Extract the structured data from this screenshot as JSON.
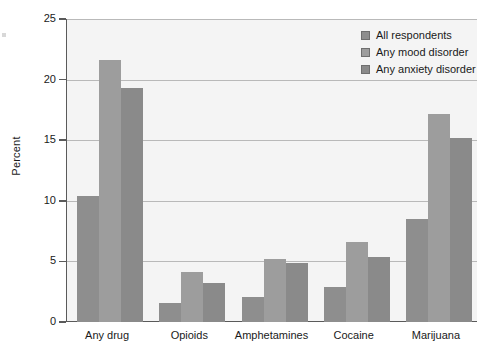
{
  "chart_data": {
    "type": "bar",
    "title": "",
    "xlabel": "",
    "ylabel": "Percent",
    "ylim": [
      0,
      25
    ],
    "yticks": [
      0,
      5,
      10,
      15,
      20,
      25
    ],
    "ytick_labels": [
      "0",
      "5",
      "10",
      "15",
      "20",
      "25"
    ],
    "grid": true,
    "legend_position": "top-right",
    "categories": [
      "Any drug",
      "Opioids",
      "Amphetamines",
      "Cocaine",
      "Marijuana"
    ],
    "series": [
      {
        "name": "All respondents",
        "color": "#8e8e8e",
        "values": [
          10.4,
          1.6,
          2.1,
          2.9,
          8.5
        ]
      },
      {
        "name": "Any mood disorder",
        "color": "#9d9d9d",
        "values": [
          21.6,
          4.1,
          5.2,
          6.6,
          17.2
        ]
      },
      {
        "name": "Any anxiety disorder",
        "color": "#8a8a8a",
        "values": [
          19.3,
          3.2,
          4.85,
          5.4,
          15.2
        ]
      }
    ]
  },
  "legend": {
    "items": [
      {
        "label": "All respondents"
      },
      {
        "label": "Any mood disorder"
      },
      {
        "label": "Any anxiety disorder"
      }
    ]
  },
  "colors": {
    "series_1": "#8e8e8e",
    "series_2": "#9d9d9d",
    "series_3": "#8a8a8a",
    "plot_background": "#f4f4f4",
    "axis": "#5a5a5a",
    "gridline": "#b9b9b9"
  }
}
